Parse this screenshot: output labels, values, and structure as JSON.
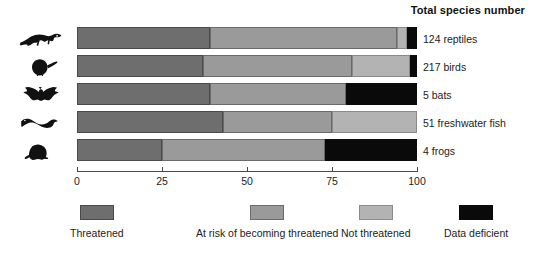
{
  "title": "Total species number",
  "chart_data": {
    "type": "bar",
    "orientation": "horizontal",
    "stacked": true,
    "stacked_normalized": true,
    "title": "Total species number",
    "xlabel": "",
    "ylabel": "",
    "xlim": [
      0,
      100
    ],
    "xticks": [
      0,
      25,
      50,
      75,
      100
    ],
    "xticklabels": [
      "0",
      "25",
      "50",
      "75",
      "100"
    ],
    "grid": false,
    "legend_position": "bottom",
    "categories": [
      "124 reptiles",
      "217 birds",
      "5 bats",
      "51 freshwater fish",
      "4 frogs"
    ],
    "category_icons": [
      "reptile-icon",
      "bird-icon",
      "bat-icon",
      "fish-icon",
      "frog-icon"
    ],
    "category_totals": [
      124,
      217,
      5,
      51,
      4
    ],
    "series": [
      {
        "name": "Threatened",
        "key": "threatened",
        "color": "#6e6e6e",
        "values": [
          39,
          37,
          39,
          43,
          25
        ]
      },
      {
        "name": "At risk of becoming threatened",
        "key": "at-risk",
        "color": "#9a9a9a",
        "values": [
          55,
          44,
          40,
          32,
          48
        ]
      },
      {
        "name": "Not threatened",
        "key": "not-threatened",
        "color": "#b3b3b3",
        "values": [
          3,
          17,
          0,
          25,
          0
        ]
      },
      {
        "name": "Data deficient",
        "key": "data-deficient",
        "color": "#0a0a0a",
        "values": [
          3,
          2,
          21,
          0,
          27
        ]
      }
    ]
  },
  "rows": [
    {
      "icon": "reptile-icon",
      "label": "124 reptiles",
      "segments": [
        {
          "key": "threatened",
          "start": 0,
          "end": 39
        },
        {
          "key": "at-risk",
          "start": 39,
          "end": 94
        },
        {
          "key": "not-threatened",
          "start": 94,
          "end": 97
        },
        {
          "key": "data-deficient",
          "start": 97,
          "end": 100
        }
      ]
    },
    {
      "icon": "bird-icon",
      "label": "217 birds",
      "segments": [
        {
          "key": "threatened",
          "start": 0,
          "end": 37
        },
        {
          "key": "at-risk",
          "start": 37,
          "end": 81
        },
        {
          "key": "not-threatened",
          "start": 81,
          "end": 98
        },
        {
          "key": "data-deficient",
          "start": 98,
          "end": 100
        }
      ]
    },
    {
      "icon": "bat-icon",
      "label": "5 bats",
      "segments": [
        {
          "key": "threatened",
          "start": 0,
          "end": 39
        },
        {
          "key": "at-risk",
          "start": 39,
          "end": 79
        },
        {
          "key": "data-deficient",
          "start": 79,
          "end": 100
        }
      ]
    },
    {
      "icon": "fish-icon",
      "label": "51 freshwater fish",
      "segments": [
        {
          "key": "threatened",
          "start": 0,
          "end": 43
        },
        {
          "key": "at-risk",
          "start": 43,
          "end": 75
        },
        {
          "key": "not-threatened",
          "start": 75,
          "end": 100
        }
      ]
    },
    {
      "icon": "frog-icon",
      "label": "4 frogs",
      "segments": [
        {
          "key": "threatened",
          "start": 0,
          "end": 25
        },
        {
          "key": "at-risk",
          "start": 25,
          "end": 73
        },
        {
          "key": "data-deficient",
          "start": 73,
          "end": 100
        }
      ]
    }
  ],
  "axis": {
    "ticks": [
      {
        "value": 0,
        "label": "0"
      },
      {
        "value": 25,
        "label": "25"
      },
      {
        "value": 50,
        "label": "50"
      },
      {
        "value": 75,
        "label": "75"
      },
      {
        "value": 100,
        "label": "100"
      }
    ]
  },
  "legend": [
    {
      "key": "threatened",
      "label": "Threatened",
      "color": "#6e6e6e",
      "x": 70
    },
    {
      "key": "at-risk",
      "label": "At risk of becoming threatened",
      "color": "#9a9a9a",
      "x": 196
    },
    {
      "key": "not-threatened",
      "label": "Not threatened",
      "color": "#b3b3b3",
      "x": 341
    },
    {
      "key": "data-deficient",
      "label": "Data deficient",
      "color": "#0a0a0a",
      "x": 444
    }
  ]
}
